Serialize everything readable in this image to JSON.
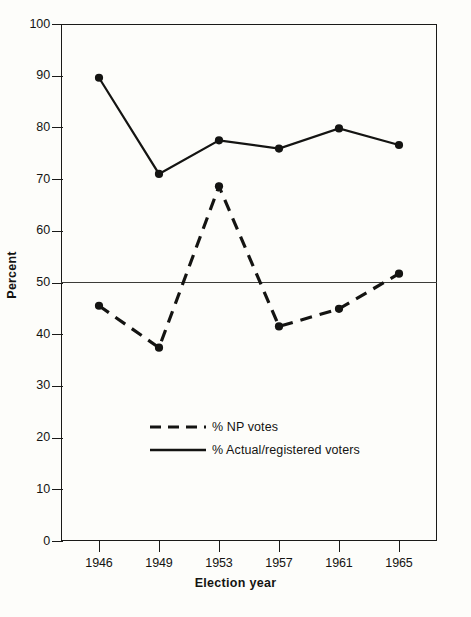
{
  "chart_data": {
    "type": "line",
    "title": "",
    "xlabel": "Election year",
    "ylabel": "Percent",
    "categories": [
      "1946",
      "1949",
      "1953",
      "1957",
      "1961",
      "1965"
    ],
    "ylim": [
      0,
      100
    ],
    "yticks": [
      0,
      10,
      20,
      30,
      40,
      50,
      60,
      70,
      80,
      90,
      100
    ],
    "ytick_labels": [
      "0",
      "10",
      "20",
      "30",
      "40",
      "50",
      "60",
      "70",
      "80",
      "90",
      "100"
    ],
    "grid": false,
    "reference_line": 50,
    "legend_position": "inside-lower-center",
    "series": [
      {
        "name": "% NP votes",
        "style": "dashed",
        "marker": "filled-circle",
        "color": "#141412",
        "values": [
          45.5,
          37.4,
          68.6,
          41.5,
          44.9,
          51.7
        ]
      },
      {
        "name": "% Actual/registered voters",
        "style": "solid",
        "marker": "filled-circle",
        "color": "#141412",
        "values": [
          89.6,
          71.0,
          77.5,
          75.9,
          79.8,
          76.6
        ]
      }
    ]
  },
  "axis": {
    "y_title": "Percent",
    "x_title": "Election year"
  },
  "legend": {
    "items": [
      {
        "label": "% NP votes",
        "style": "dashed"
      },
      {
        "label": "% Actual/registered voters",
        "style": "solid"
      }
    ]
  },
  "caption": {
    "text": ""
  }
}
